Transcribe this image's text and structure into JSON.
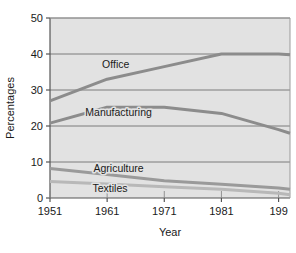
{
  "chart_data": {
    "type": "line",
    "title": "",
    "xlabel": "Year",
    "ylabel": "Percentages",
    "xlim": [
      1951,
      1993
    ],
    "ylim": [
      0,
      50
    ],
    "grid": true,
    "legend_position": "inline-labels",
    "plot_background": "#e2e2e2",
    "x_ticks": [
      "1951",
      "1961",
      "1971",
      "1981",
      "199"
    ],
    "x_tick_values": [
      1951,
      1961,
      1971,
      1981,
      1991
    ],
    "y_ticks": [
      "0",
      "10",
      "20",
      "30",
      "40",
      "50"
    ],
    "y_tick_values": [
      0,
      10,
      20,
      30,
      40,
      50
    ],
    "x": [
      1951,
      1961,
      1971,
      1981,
      1991,
      1993
    ],
    "series": [
      {
        "name": "Office",
        "label": "Office",
        "color": "#8c8c8c",
        "values": [
          27.0,
          33.0,
          36.5,
          40.0,
          40.0,
          39.8
        ]
      },
      {
        "name": "Manufacturing",
        "label": "Manufacturing",
        "color": "#8c8c8c",
        "values": [
          20.8,
          25.2,
          25.2,
          23.5,
          19.0,
          18.0
        ]
      },
      {
        "name": "Agriculture",
        "label": "Agriculture",
        "color": "#9a9a9a",
        "values": [
          8.2,
          6.5,
          4.8,
          3.8,
          2.8,
          2.4
        ]
      },
      {
        "name": "Textiles",
        "label": "Textiles",
        "color": "#b8b8b8",
        "values": [
          4.6,
          3.9,
          3.1,
          2.4,
          1.3,
          0.9
        ]
      }
    ],
    "annotations": [
      {
        "text": "Office",
        "x": 1962.5,
        "y": 36.0
      },
      {
        "text": "Manufacturing",
        "x": 1963.0,
        "y": 22.8
      },
      {
        "text": "Agriculture",
        "x": 1963.0,
        "y": 7.2
      },
      {
        "text": "Textiles",
        "x": 1961.5,
        "y": 1.8
      }
    ]
  }
}
